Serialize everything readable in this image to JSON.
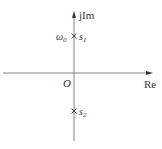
{
  "diagram": {
    "type": "pole-zero plot (s-plane)",
    "axes": {
      "imaginary_label": "jIm",
      "real_label": "Re",
      "origin_label": "O"
    },
    "poles": [
      {
        "name": "s1",
        "label_base": "s",
        "label_sub": "1",
        "marker": "×",
        "position": "upper imaginary axis",
        "value_label_base": "ω",
        "value_label_sub": "0"
      },
      {
        "name": "s2",
        "label_base": "s",
        "label_sub": "2",
        "marker": "×",
        "position": "lower imaginary axis"
      }
    ],
    "colors": {
      "axis": "#777777",
      "text": "#333333"
    }
  }
}
